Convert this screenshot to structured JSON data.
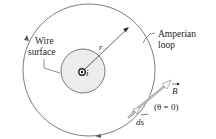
{
  "labels": {
    "wire_line1": "Wire",
    "wire_line2": "surface",
    "radius": "r",
    "current": "i",
    "loop_line1": "Amperian",
    "loop_line2": "loop",
    "field_vector": "B",
    "length_element": "ds",
    "angle_note": "(θ = 0)"
  },
  "colors": {
    "line": "#5a5a5a",
    "wire_fill": "#ececec",
    "vector": "#b5b5b5",
    "text": "#231f20"
  }
}
